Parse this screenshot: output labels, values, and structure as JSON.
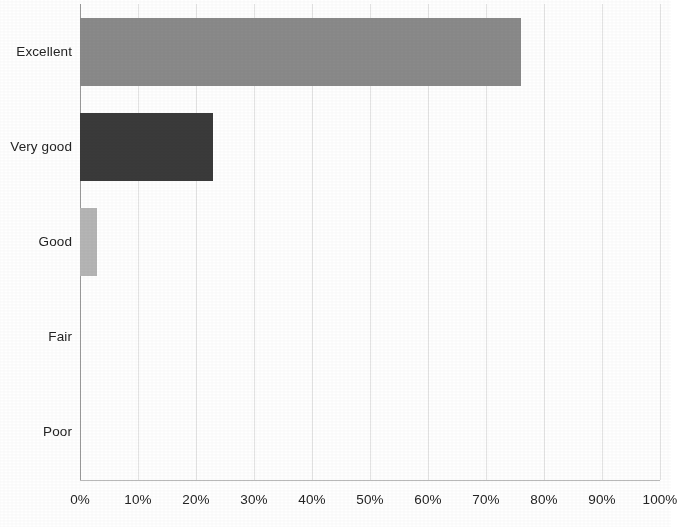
{
  "chart_data": {
    "type": "bar",
    "orientation": "horizontal",
    "title": "",
    "subtitle": "",
    "xlabel": "",
    "ylabel": "",
    "categories": [
      "Excellent",
      "Very good",
      "Good",
      "Fair",
      "Poor"
    ],
    "values": [
      76,
      23,
      3,
      0,
      0
    ],
    "value_unit": "%",
    "xlim": [
      0,
      100
    ],
    "xticks": [
      0,
      10,
      20,
      30,
      40,
      50,
      60,
      70,
      80,
      90,
      100
    ],
    "xticklabels": [
      "0%",
      "10%",
      "20%",
      "30%",
      "40%",
      "50%",
      "60%",
      "70%",
      "80%",
      "90%",
      "100%"
    ],
    "grid": true,
    "grid_axis": "x",
    "legend": false,
    "legend_position": "none",
    "bar_colors": [
      "#8a8a8a",
      "#3a3a3a",
      "#b5b5b5",
      "#8a8a8a",
      "#8a8a8a"
    ],
    "annotations": []
  },
  "style": {
    "background": "#ffffff",
    "gridline_color": "#e4e4e4",
    "axis_color": "#9a9a9a",
    "tick_label_color": "#242424"
  }
}
